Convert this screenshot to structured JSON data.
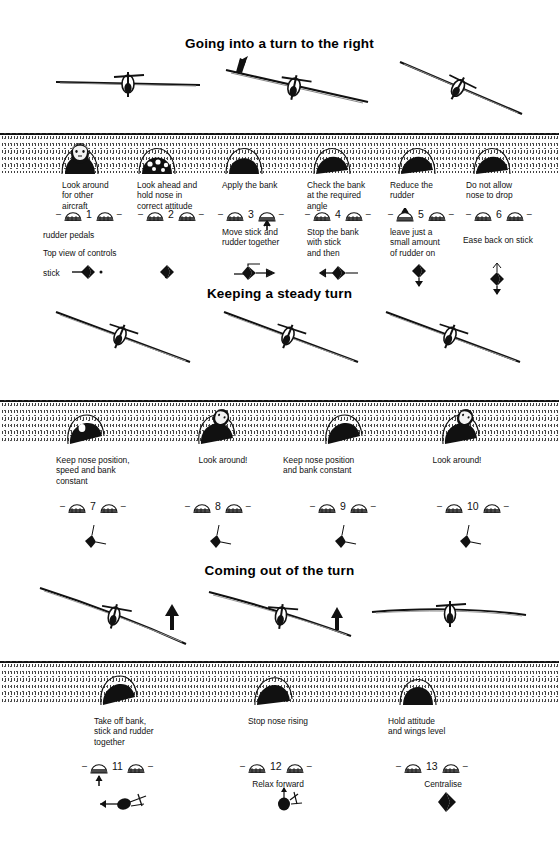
{
  "document": {
    "title": "Going into a turn to the right",
    "sections": [
      {
        "id": "entering",
        "heading": "Going into a turn to the right",
        "steps": [
          {
            "number": "1",
            "caption": "Look around\nfor other\naircraft",
            "subcaption": "",
            "view": "pilot-head",
            "rudder_arrow": "none",
            "stick_arrow": "none"
          },
          {
            "number": "2",
            "caption": "Look ahead and\nhold nose in\ncorrect attitude",
            "subcaption": "",
            "view": "instrument-panel",
            "rudder_arrow": "none",
            "stick_arrow": "none"
          },
          {
            "number": "3",
            "caption": "Apply the bank",
            "subcaption": "Move stick and\nrudder together",
            "view": "nose-level",
            "rudder_arrow": "up-right",
            "stick_arrow": "right"
          },
          {
            "number": "4",
            "caption": "Check the bank\nat the required\nangle",
            "subcaption": "Stop the bank\nwith stick\nand then",
            "view": "nose-banked",
            "rudder_arrow": "none",
            "stick_arrow": "left"
          },
          {
            "number": "5",
            "caption": "Reduce the\nrudder",
            "subcaption": "leave just a\nsmall amount\nof rudder on",
            "view": "nose-banked",
            "rudder_arrow": "up-left",
            "stick_arrow": "down"
          },
          {
            "number": "6",
            "caption": "Do not allow\nnose to drop",
            "subcaption": "Ease back on stick",
            "view": "nose-banked",
            "rudder_arrow": "none",
            "stick_arrow": "back"
          }
        ],
        "legend": {
          "rudder_pedals_label": "rudder pedals",
          "top_view_label": "Top view of controls",
          "stick_label": "stick"
        }
      },
      {
        "id": "holding",
        "heading": "Keeping a steady turn",
        "steps": [
          {
            "number": "7",
            "caption": "Keep nose position,\nspeed and bank\nconstant",
            "subcaption": "",
            "view": "nose-banked",
            "rudder_arrow": "none",
            "stick_arrow": "held"
          },
          {
            "number": "8",
            "caption": "Look around!",
            "subcaption": "",
            "view": "pilot-head-banked",
            "rudder_arrow": "none",
            "stick_arrow": "held"
          },
          {
            "number": "9",
            "caption": "Keep nose position\nand bank constant",
            "subcaption": "",
            "view": "nose-banked",
            "rudder_arrow": "none",
            "stick_arrow": "held"
          },
          {
            "number": "10",
            "caption": "Look around!",
            "subcaption": "",
            "view": "pilot-head-banked",
            "rudder_arrow": "none",
            "stick_arrow": "held"
          }
        ]
      },
      {
        "id": "exiting",
        "heading": "Coming out of the turn",
        "steps": [
          {
            "number": "11",
            "caption": "Take off bank,\nstick and rudder\ntogether",
            "subcaption": "",
            "view": "nose-banked",
            "rudder_arrow": "up-left",
            "stick_arrow": "left"
          },
          {
            "number": "12",
            "caption": "Stop nose rising",
            "subcaption": "Relax forward",
            "view": "nose-rising",
            "rudder_arrow": "up-left",
            "stick_arrow": "forward"
          },
          {
            "number": "13",
            "caption": "Hold attitude\nand wings level",
            "subcaption": "Centralise",
            "view": "nose-level",
            "rudder_arrow": "none",
            "stick_arrow": "centre"
          }
        ]
      }
    ],
    "colors": {
      "ink": "#111111",
      "paper": "#ffffff",
      "ground": "#2a2a2a"
    }
  }
}
